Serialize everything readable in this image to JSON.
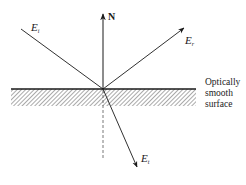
{
  "diagram": {
    "type": "reflection-refraction",
    "labels": {
      "normal": "N",
      "incident": "E",
      "incident_sub": "i",
      "reflected": "E",
      "reflected_sub": "r",
      "transmitted": "E",
      "transmitted_sub": "t"
    },
    "surface_label": {
      "line1": "Optically",
      "line2": "smooth",
      "line3": "surface"
    },
    "colors": {
      "line": "#1a1a1a",
      "hatch": "#555555",
      "background": "#ffffff"
    }
  }
}
